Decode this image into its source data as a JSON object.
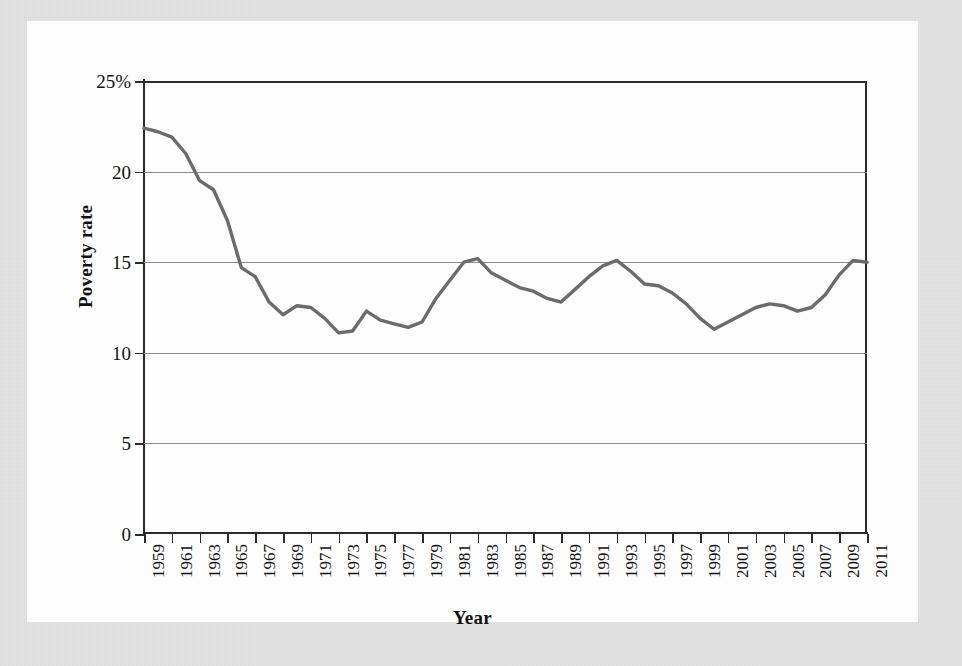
{
  "figure": {
    "background_color": "#e4e4e4",
    "panel_color": "#fdfdfd",
    "axis_color": "#2b2b2b",
    "grid_color": "#8a8a8a",
    "line_color": "#6b6b6b"
  },
  "axis_titles": {
    "y": "Poverty rate",
    "x": "Year"
  },
  "chart_data": {
    "type": "line",
    "title": "",
    "xlabel": "Year",
    "ylabel": "Poverty rate",
    "ylim": [
      0,
      25
    ],
    "xlim": [
      1959,
      2011
    ],
    "grid": true,
    "legend": "none",
    "line_color": "#6b6b6b",
    "y_ticks": [
      0,
      5,
      10,
      15,
      20,
      25
    ],
    "y_tick_labels": [
      "0",
      "5",
      "10",
      "15",
      "20",
      "25%"
    ],
    "x_ticks": [
      1959,
      1961,
      1963,
      1965,
      1967,
      1969,
      1971,
      1973,
      1975,
      1977,
      1979,
      1981,
      1983,
      1985,
      1987,
      1989,
      1991,
      1993,
      1995,
      1997,
      1999,
      2001,
      2003,
      2005,
      2007,
      2009,
      2011
    ],
    "x_tick_labels": [
      "1959",
      "1961",
      "1963",
      "1965",
      "1967",
      "1969",
      "1971",
      "1973",
      "1975",
      "1977",
      "1979",
      "1981",
      "1983",
      "1985",
      "1987",
      "1989",
      "1991",
      "1993",
      "1995",
      "1997",
      "1999",
      "2001",
      "2003",
      "2005",
      "2007",
      "2009",
      "2011"
    ],
    "x": [
      1959,
      1960,
      1961,
      1962,
      1963,
      1964,
      1965,
      1966,
      1967,
      1968,
      1969,
      1970,
      1971,
      1972,
      1973,
      1974,
      1975,
      1976,
      1977,
      1978,
      1979,
      1980,
      1981,
      1982,
      1983,
      1984,
      1985,
      1986,
      1987,
      1988,
      1989,
      1990,
      1991,
      1992,
      1993,
      1994,
      1995,
      1996,
      1997,
      1998,
      1999,
      2000,
      2001,
      2002,
      2003,
      2004,
      2005,
      2006,
      2007,
      2008,
      2009,
      2010,
      2011
    ],
    "values": [
      22.4,
      22.2,
      21.9,
      21.0,
      19.5,
      19.0,
      17.3,
      14.7,
      14.2,
      12.8,
      12.1,
      12.6,
      12.5,
      11.9,
      11.1,
      11.2,
      12.3,
      11.8,
      11.6,
      11.4,
      11.7,
      13.0,
      14.0,
      15.0,
      15.2,
      14.4,
      14.0,
      13.6,
      13.4,
      13.0,
      12.8,
      13.5,
      14.2,
      14.8,
      15.1,
      14.5,
      13.8,
      13.7,
      13.3,
      12.7,
      11.9,
      11.3,
      11.7,
      12.1,
      12.5,
      12.7,
      12.6,
      12.3,
      12.5,
      13.2,
      14.3,
      15.1,
      15.0
    ]
  }
}
